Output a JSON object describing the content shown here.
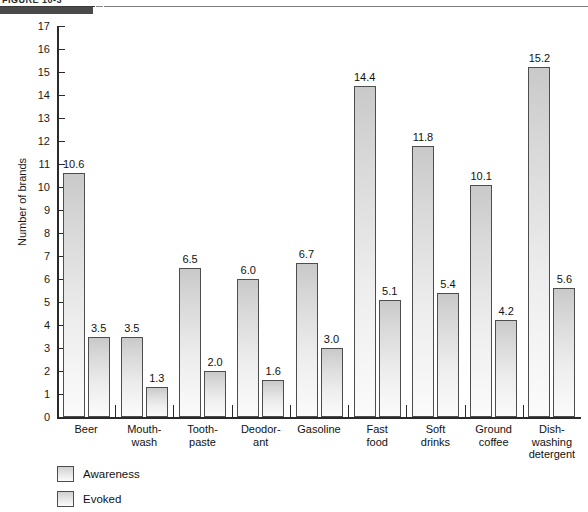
{
  "header": {
    "figure_caption": "FIGURE 10-3",
    "rule_color": "#4a4a4a"
  },
  "chart_data": {
    "type": "bar",
    "title": "",
    "xlabel": "",
    "ylabel": "Number of brands",
    "ylim": [
      0,
      17
    ],
    "ytick_labels": [
      "17",
      "16",
      "15",
      "14",
      "13",
      "12",
      "11",
      "10",
      "9",
      "8",
      "7",
      "6",
      "5",
      "4",
      "3",
      "2",
      "1",
      "0"
    ],
    "grid": false,
    "legend_position": "bottom-left",
    "categories": [
      "Beer",
      "Mouth-\nwash",
      "Tooth-\npaste",
      "Deodor-\nant",
      "Gasoline",
      "Fast\nfood",
      "Soft\ndrinks",
      "Ground\ncoffee",
      "Dish-\nwashing\ndetergent"
    ],
    "series": [
      {
        "name": "Awareness",
        "values": [
          10.6,
          3.5,
          6.5,
          6.0,
          6.7,
          14.4,
          11.8,
          10.1,
          15.2
        ],
        "labels": [
          "10.6",
          "3.5",
          "6.5",
          "6.0",
          "6.7",
          "14.4",
          "11.8",
          "10.1",
          "15.2"
        ]
      },
      {
        "name": "Evoked",
        "values": [
          3.5,
          1.3,
          2.0,
          1.6,
          3.0,
          5.1,
          5.4,
          4.2,
          5.6
        ],
        "labels": [
          "3.5",
          "1.3",
          "2.0",
          "1.6",
          "3.0",
          "5.1",
          "5.4",
          "4.2",
          "5.6"
        ]
      }
    ],
    "bar_fill_top": "#c9c9c9",
    "bar_fill_bottom": "#fbfbfb",
    "bar_border": "#4d4d4d",
    "axis_color": "#2a2a2a"
  },
  "legend": {
    "items": [
      {
        "label": "Awareness"
      },
      {
        "label": "Evoked"
      }
    ]
  }
}
